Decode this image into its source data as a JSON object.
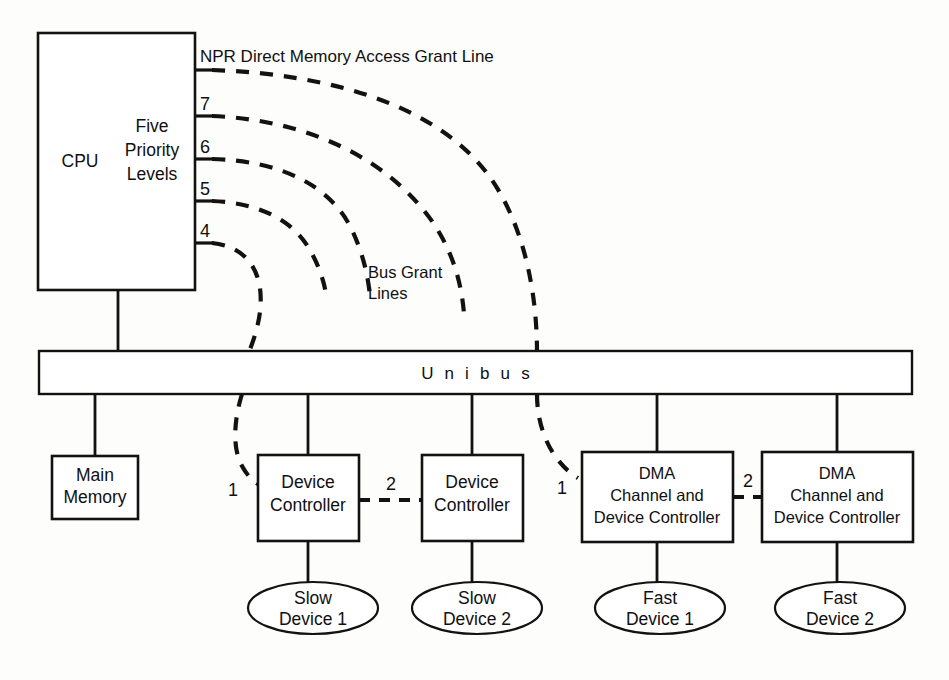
{
  "diagram": {
    "colors": {
      "stroke": "#121212",
      "background": "#ffffff"
    },
    "cpu": {
      "left_label": "CPU",
      "right_label_line1": "Five",
      "right_label_line2": "Priority",
      "right_label_line3": "Levels"
    },
    "priority_levels": [
      {
        "id": "npr",
        "label": "",
        "line_label": "NPR Direct Memory Access Grant Line"
      },
      {
        "id": "level7",
        "label": "7"
      },
      {
        "id": "level6",
        "label": "6"
      },
      {
        "id": "level5",
        "label": "5"
      },
      {
        "id": "level4",
        "label": "4"
      }
    ],
    "bus_grant_label_line1": "Bus Grant",
    "bus_grant_label_line2": "Lines",
    "bus": {
      "label": "U n i b u s"
    },
    "nodes": {
      "main_memory": {
        "line1": "Main",
        "line2": "Memory"
      },
      "device_controller_1": {
        "line1": "Device",
        "line2": "Controller"
      },
      "device_controller_2": {
        "line1": "Device",
        "line2": "Controller"
      },
      "dma_1": {
        "line1": "DMA",
        "line2": "Channel and",
        "line3": "Device Controller"
      },
      "dma_2": {
        "line1": "DMA",
        "line2": "Channel and",
        "line3": "Device Controller"
      }
    },
    "devices": [
      {
        "id": "slow-device-1",
        "line1": "Slow",
        "line2": "Device 1"
      },
      {
        "id": "slow-device-2",
        "line1": "Slow",
        "line2": "Device 2"
      },
      {
        "id": "fast-device-1",
        "line1": "Fast",
        "line2": "Device 1"
      },
      {
        "id": "fast-device-2",
        "line1": "Fast",
        "line2": "Device 2"
      }
    ],
    "daisy_chain_numbers": {
      "bg_in_dc1": "1",
      "bg_dc1_to_dc2": "2",
      "npr_in_dma1": "1",
      "npr_dma1_to_dma2": "2"
    }
  }
}
